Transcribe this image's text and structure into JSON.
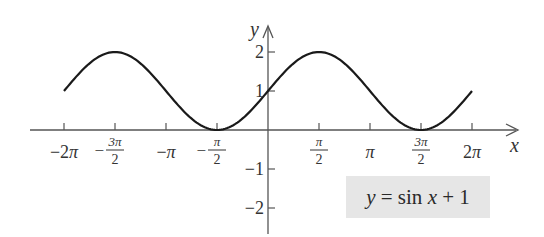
{
  "chart_data": {
    "type": "line",
    "title": "",
    "equation": "y = sin x + 1",
    "xlabel": "x",
    "ylabel": "y",
    "xlim": [
      -6.2832,
      6.2832
    ],
    "ylim": [
      -2,
      2
    ],
    "x_ticks": [
      "-2π",
      "-3π/2",
      "-π",
      "-π/2",
      "π/2",
      "π",
      "3π/2",
      "2π"
    ],
    "y_ticks": [
      "2",
      "1",
      "-1",
      "-2"
    ],
    "series": [
      {
        "name": "y = sin x + 1",
        "x": [
          -6.2832,
          -4.7124,
          -3.1416,
          -1.5708,
          0,
          1.5708,
          3.1416,
          4.7124,
          6.2832
        ],
        "y": [
          1,
          2,
          1,
          0,
          1,
          2,
          1,
          0,
          1
        ]
      }
    ],
    "legend": {
      "text": "y = sin x + 1",
      "position": "lower-right",
      "background": "#e6e6e6"
    },
    "grid": false,
    "line_color": "#1a1a1a"
  },
  "labels": {
    "x_axis": "x",
    "y_axis": "y",
    "legend_y": "y",
    "legend_eq": " = sin ",
    "legend_x": "x",
    "legend_tail": " + 1"
  }
}
